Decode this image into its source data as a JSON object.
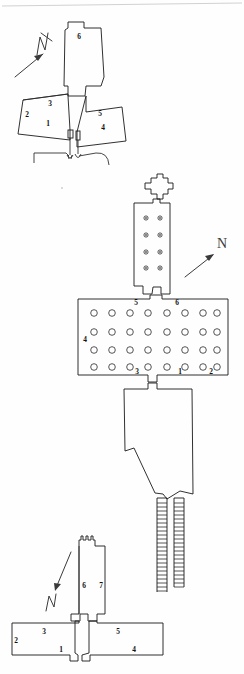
{
  "document": {
    "type": "archaeological-floor-plan",
    "title": "",
    "background_color": "#fefefe",
    "ink_color": "#1a1a1a",
    "width": 244,
    "height": 674
  },
  "plans": [
    {
      "id": "plan-top",
      "name": "upper-plan",
      "room_labels": [
        "6",
        "3",
        "2",
        "1",
        "5",
        "4"
      ],
      "north_arrow": {
        "label": "N",
        "direction": "up-right",
        "glyph": "north-arrow-icon"
      }
    },
    {
      "id": "plan-middle",
      "name": "middle-plan",
      "room_labels": [
        "5",
        "6",
        "4",
        "3",
        "1",
        "2"
      ],
      "pillar_count_antechamber": 8,
      "pillar_count_hall": 32,
      "hall_pillar_rows": 4,
      "hall_pillar_columns": 8,
      "north_arrow": {
        "label": "N",
        "direction": "up-right",
        "glyph": "north-arrow-icon"
      }
    },
    {
      "id": "plan-bottom",
      "name": "lower-plan",
      "room_labels": [
        "6",
        "7",
        "3",
        "2",
        "1",
        "5",
        "4"
      ],
      "north_arrow": {
        "label": "N",
        "direction": "down-left",
        "glyph": "north-arrow-icon"
      }
    }
  ],
  "labels": {
    "top": {
      "r6": "6",
      "r3": "3",
      "r2": "2",
      "r1": "1",
      "r5": "5",
      "r4": "4"
    },
    "middle": {
      "r5": "5",
      "r6": "6",
      "r4": "4",
      "r3": "3",
      "r1": "1",
      "r2": "2"
    },
    "bottom": {
      "r6": "6",
      "r7": "7",
      "r3": "3",
      "r2": "2",
      "r1": "1",
      "r5": "5",
      "r4": "4"
    }
  },
  "north": {
    "top_letter": "N",
    "middle_letter": "N",
    "bottom_letter": "N"
  }
}
